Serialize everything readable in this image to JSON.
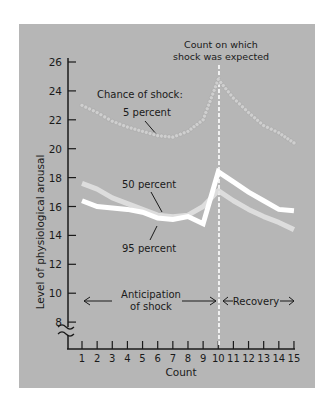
{
  "chart_data": {
    "type": "line",
    "title": "",
    "xlabel": "Count",
    "ylabel": "Level of physiological arousal",
    "x": [
      1,
      2,
      3,
      4,
      5,
      6,
      7,
      8,
      9,
      10,
      11,
      12,
      13,
      14,
      15
    ],
    "x_ticks": [
      "1",
      "2",
      "3",
      "4",
      "5",
      "6",
      "7",
      "8",
      "9",
      "10",
      "11",
      "12",
      "13",
      "14",
      "15"
    ],
    "y_ticks": [
      "8",
      "10",
      "12",
      "14",
      "16",
      "18",
      "20",
      "22",
      "24",
      "26"
    ],
    "ylim": [
      7,
      26
    ],
    "y_axis_break": true,
    "grid": false,
    "series": [
      {
        "name": "5 percent",
        "style": "dotted-beads",
        "values": [
          23.0,
          22.5,
          21.9,
          21.5,
          21.2,
          20.9,
          20.8,
          21.2,
          22.0,
          24.8,
          23.5,
          22.5,
          21.6,
          21.1,
          20.4
        ]
      },
      {
        "name": "50 percent",
        "style": "faint-white",
        "values": [
          17.6,
          17.2,
          16.6,
          16.2,
          15.8,
          15.4,
          15.3,
          15.4,
          16.0,
          17.1,
          16.4,
          15.8,
          15.3,
          14.9,
          14.4
        ]
      },
      {
        "name": "95 percent",
        "style": "bright-white",
        "values": [
          16.4,
          16.0,
          15.9,
          15.8,
          15.6,
          15.2,
          15.1,
          15.3,
          14.8,
          18.4,
          17.7,
          17.0,
          16.4,
          15.8,
          15.7
        ]
      }
    ],
    "annotations": {
      "legend_header": "Chance of shock:",
      "label_5": "5 percent",
      "label_50": "50 percent",
      "label_95": "95 percent",
      "shock_line_title_1": "Count on which",
      "shock_line_title_2": "shock was expected",
      "anticipation_1": "Anticipation",
      "anticipation_2": "of shock",
      "recovery": "Recovery",
      "shock_count": 10
    },
    "colors": {
      "panel": "#b6b6b6",
      "axis": "#1a1a1a",
      "line_50": "#e4e4e4",
      "line_95": "#ffffff",
      "beads": "#cfcfcf",
      "dashed": "#ffffff"
    }
  }
}
